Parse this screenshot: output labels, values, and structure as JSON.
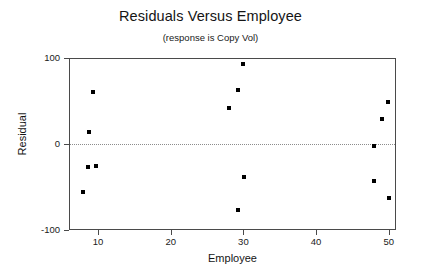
{
  "chart_data": {
    "type": "scatter",
    "title": "Residuals Versus Employee",
    "subtitle": "(response is Copy Vol)",
    "xlabel": "Employee",
    "ylabel": "Residual",
    "xlim": [
      6,
      51
    ],
    "ylim": [
      -100,
      100
    ],
    "xticks": [
      10,
      20,
      30,
      40,
      50
    ],
    "yticks": [
      100,
      0,
      -100
    ],
    "grid": false,
    "legend": "none",
    "reference_line": {
      "y": 0,
      "style": "dotted"
    },
    "points": [
      {
        "x": 9.3,
        "y": 60
      },
      {
        "x": 8.7,
        "y": 14
      },
      {
        "x": 8.6,
        "y": -27
      },
      {
        "x": 9.7,
        "y": -26
      },
      {
        "x": 7.9,
        "y": -56
      },
      {
        "x": 30.0,
        "y": 93
      },
      {
        "x": 29.3,
        "y": 63
      },
      {
        "x": 28.0,
        "y": 42
      },
      {
        "x": 30.1,
        "y": -38
      },
      {
        "x": 29.3,
        "y": -77
      },
      {
        "x": 49.9,
        "y": 49
      },
      {
        "x": 49.1,
        "y": 29
      },
      {
        "x": 48.0,
        "y": -2
      },
      {
        "x": 48.0,
        "y": -43
      },
      {
        "x": 50.0,
        "y": -63
      }
    ]
  }
}
